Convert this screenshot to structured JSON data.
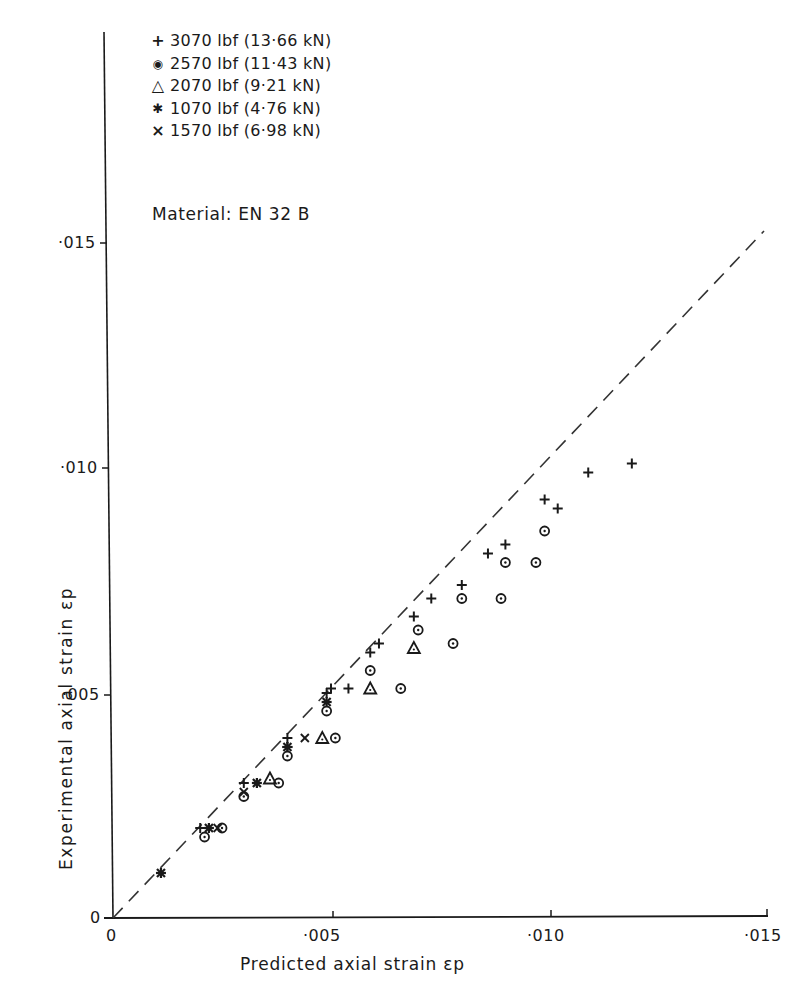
{
  "chart_data": {
    "type": "scatter",
    "title": "",
    "xlabel": "Predicted axial strain εp",
    "ylabel": "Experimental axial strain εp",
    "xlim": [
      0,
      0.015
    ],
    "ylim": [
      0,
      0.015
    ],
    "x_ticks": [
      "0",
      "·005",
      "·010",
      "·015"
    ],
    "y_ticks": [
      "0",
      "·005",
      "·010",
      "·015"
    ],
    "grid": false,
    "legend_position": "upper-left",
    "annotation": "Material: EN 32 B",
    "reference_line": {
      "type": "dashed",
      "label": "y = x",
      "from": [
        0,
        0
      ],
      "to": [
        0.0149,
        0.0152
      ]
    },
    "series": [
      {
        "name": "3070 lbf (13·66 kN)",
        "marker": "plus",
        "points": [
          [
            0.002,
            0.002
          ],
          [
            0.003,
            0.003
          ],
          [
            0.004,
            0.004
          ],
          [
            0.004,
            0.0038
          ],
          [
            0.0049,
            0.005
          ],
          [
            0.005,
            0.0051
          ],
          [
            0.0054,
            0.0051
          ],
          [
            0.0059,
            0.0059
          ],
          [
            0.0061,
            0.0061
          ],
          [
            0.0069,
            0.0067
          ],
          [
            0.0073,
            0.0071
          ],
          [
            0.008,
            0.0074
          ],
          [
            0.0086,
            0.0081
          ],
          [
            0.009,
            0.0083
          ],
          [
            0.0099,
            0.0093
          ],
          [
            0.0102,
            0.0091
          ],
          [
            0.0109,
            0.0099
          ],
          [
            0.0119,
            0.0101
          ]
        ]
      },
      {
        "name": "2570 lbf (11·43 kN)",
        "marker": "circle-dot",
        "points": [
          [
            0.0021,
            0.0018
          ],
          [
            0.0025,
            0.002
          ],
          [
            0.003,
            0.0027
          ],
          [
            0.0038,
            0.003
          ],
          [
            0.004,
            0.0036
          ],
          [
            0.0049,
            0.0046
          ],
          [
            0.0051,
            0.004
          ],
          [
            0.0059,
            0.0055
          ],
          [
            0.0066,
            0.0051
          ],
          [
            0.007,
            0.0064
          ],
          [
            0.0078,
            0.0061
          ],
          [
            0.008,
            0.0071
          ],
          [
            0.0089,
            0.0071
          ],
          [
            0.009,
            0.0079
          ],
          [
            0.0097,
            0.0079
          ],
          [
            0.0099,
            0.0086
          ]
        ]
      },
      {
        "name": "2070 lbf (9·21 kN)",
        "marker": "triangle",
        "points": [
          [
            0.0036,
            0.0031
          ],
          [
            0.0048,
            0.004
          ],
          [
            0.0059,
            0.0051
          ],
          [
            0.0069,
            0.006
          ]
        ]
      },
      {
        "name": "1070 lbf (4·76 kN)",
        "marker": "asterisk",
        "points": [
          [
            0.0011,
            0.001
          ],
          [
            0.0022,
            0.002
          ],
          [
            0.0033,
            0.003
          ],
          [
            0.004,
            0.0038
          ],
          [
            0.0049,
            0.0048
          ]
        ]
      },
      {
        "name": "1570 lbf (6·98 kN)",
        "marker": "cross",
        "points": [
          [
            0.0024,
            0.002
          ],
          [
            0.003,
            0.0028
          ],
          [
            0.0044,
            0.004
          ]
        ]
      }
    ]
  },
  "legend": {
    "items": [
      {
        "symbol": "+",
        "label": "3070 lbf (13·66 kN)"
      },
      {
        "symbol": "◉",
        "label": "2570 lbf (11·43 kN)"
      },
      {
        "symbol": "△",
        "label": "2070 lbf (9·21 kN)"
      },
      {
        "symbol": "✱",
        "label": "1070 lbf (4·76 kN)"
      },
      {
        "symbol": "×",
        "label": "1570 lbf (6·98 kN)"
      }
    ]
  },
  "material": "Material: EN 32 B",
  "axes": {
    "x_label": "Predicted axial strain εp",
    "y_label": "Experimental axial strain εp",
    "x_ticks": [
      "·005",
      "·010",
      "·015"
    ],
    "y_ticks": [
      "·005",
      "·010",
      "·015"
    ],
    "x_origin": "0",
    "y_origin": "0"
  }
}
